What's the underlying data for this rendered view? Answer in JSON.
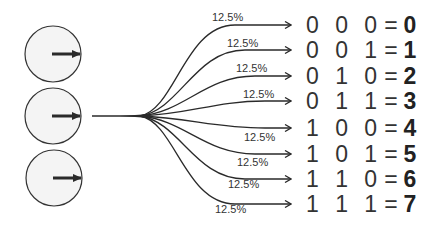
{
  "diagram": {
    "qubits": [
      {
        "label": "",
        "icon": "arrow-right-icon"
      },
      {
        "label": "",
        "icon": "arrow-right-icon"
      },
      {
        "label": "",
        "icon": "arrow-right-icon"
      }
    ],
    "outcomes": [
      {
        "bits": "0 0 0",
        "equals": "=",
        "value": "0",
        "probability": "12.5%"
      },
      {
        "bits": "0 0 1",
        "equals": "=",
        "value": "1",
        "probability": "12.5%"
      },
      {
        "bits": "0 1 0",
        "equals": "=",
        "value": "2",
        "probability": "12.5%"
      },
      {
        "bits": "0 1 1",
        "equals": "=",
        "value": "3",
        "probability": "12.5%"
      },
      {
        "bits": "1 0 0",
        "equals": "=",
        "value": "4",
        "probability": "12.5%"
      },
      {
        "bits": "1 0 1",
        "equals": "=",
        "value": "5",
        "probability": "12.5%"
      },
      {
        "bits": "1 1 0",
        "equals": "=",
        "value": "6",
        "probability": "12.5%"
      },
      {
        "bits": "1 1 1",
        "equals": "=",
        "value": "7",
        "probability": "12.5%"
      }
    ],
    "colors": {
      "stroke": "#2a2a2a",
      "circle_fill": "#f4f4f4"
    }
  }
}
